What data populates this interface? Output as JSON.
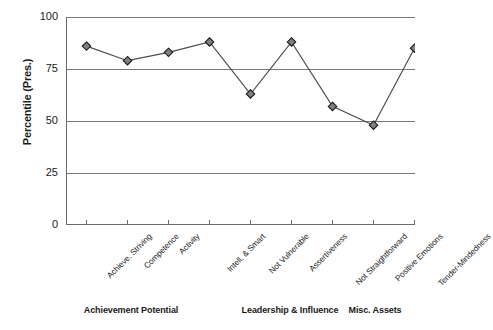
{
  "chart_data": {
    "type": "line",
    "title": "",
    "subtitle": "",
    "xlabel": "",
    "ylabel": "Percentile (Pres.)",
    "ylim": [
      0,
      100
    ],
    "yticks": [
      0,
      25,
      50,
      75,
      100
    ],
    "ytick_labels": [
      "0",
      "25",
      "50",
      "75",
      "100"
    ],
    "grid": "horizontal",
    "legend": "none",
    "marker": "diamond",
    "marker_color": "#808080",
    "marker_edge_color": "#1a1a1a",
    "line_color": "#4d4d4d",
    "categories": [
      "Achieve. Striving",
      "Competence",
      "Activity",
      "Intell. & Smart",
      "Not Vulnerable",
      "Assertiveness",
      "Not Straightforward",
      "Positive Emotions",
      "Tender-Mindedness"
    ],
    "values": [
      86,
      79,
      83,
      88,
      63,
      88,
      57,
      48,
      85
    ],
    "series": [
      {
        "name": "Percentile (Pres.)",
        "values": [
          86,
          79,
          83,
          88,
          63,
          88,
          57,
          48,
          85
        ]
      }
    ],
    "group_labels": [
      "Achievement Potential",
      "Leadership & Influence",
      "Misc. Assets"
    ],
    "groups": [
      {
        "label": "Achievement Potential",
        "categories": [
          "Achieve. Striving",
          "Competence",
          "Activity",
          "Intell. & Smart"
        ]
      },
      {
        "label": "Leadership & Influence",
        "categories": [
          "Not Vulnerable",
          "Assertiveness",
          "Not Straightforward"
        ]
      },
      {
        "label": "Misc. Assets",
        "categories": [
          "Positive Emotions",
          "Tender-Mindedness"
        ]
      }
    ]
  }
}
